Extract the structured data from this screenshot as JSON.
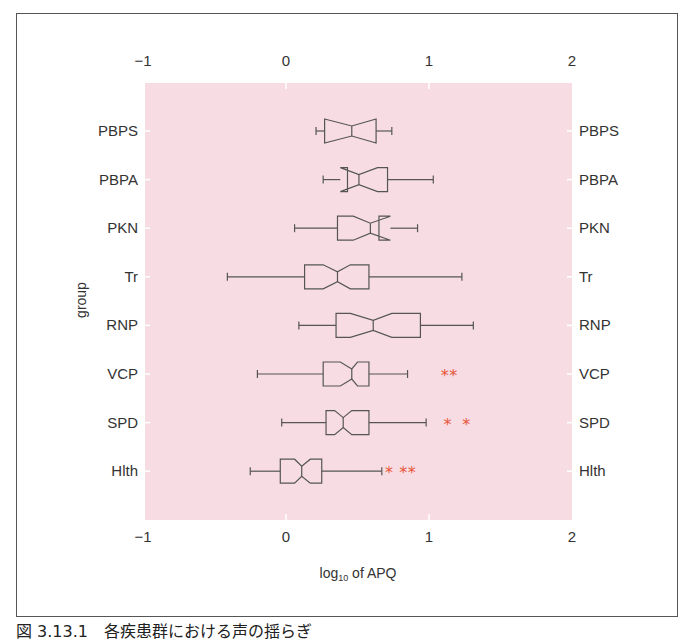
{
  "chart_data": {
    "type": "boxplot",
    "orientation": "horizontal",
    "notched": true,
    "title": "",
    "xlabel": "log10 of APQ",
    "xlabel_main": "log",
    "xlabel_sub": "10",
    "xlabel_rest": " of APQ",
    "ylabel": "group",
    "xlim": [
      -1,
      2
    ],
    "xticks": [
      -1,
      0,
      1,
      2
    ],
    "xtick_labels": [
      "−1",
      "0",
      "1",
      "2"
    ],
    "grid": false,
    "background_color": "#f7dde3",
    "outlier_color": "#e8553a",
    "outlier_marker": "*",
    "categories": [
      "PBPS",
      "PBPA",
      "PKN",
      "Tr",
      "RNP",
      "VCP",
      "SPD",
      "Hlth"
    ],
    "series": [
      {
        "name": "PBPS",
        "whisker_low": 0.21,
        "q1": 0.27,
        "notch_low": 0.27,
        "median": 0.46,
        "notch_high": 0.63,
        "q3": 0.63,
        "whisker_high": 0.74,
        "outliers": []
      },
      {
        "name": "PBPA",
        "whisker_low": 0.26,
        "q1": 0.43,
        "notch_low": 0.38,
        "median": 0.51,
        "notch_high": 0.64,
        "q3": 0.71,
        "whisker_high": 1.03,
        "outliers": []
      },
      {
        "name": "PKN",
        "whisker_low": 0.06,
        "q1": 0.36,
        "notch_low": 0.47,
        "median": 0.59,
        "notch_high": 0.73,
        "q3": 0.65,
        "whisker_high": 0.92,
        "outliers": []
      },
      {
        "name": "Tr",
        "whisker_low": -0.41,
        "q1": 0.13,
        "notch_low": 0.26,
        "median": 0.36,
        "notch_high": 0.45,
        "q3": 0.58,
        "whisker_high": 1.23,
        "outliers": []
      },
      {
        "name": "RNP",
        "whisker_low": 0.09,
        "q1": 0.35,
        "notch_low": 0.45,
        "median": 0.61,
        "notch_high": 0.74,
        "q3": 0.94,
        "whisker_high": 1.31,
        "outliers": []
      },
      {
        "name": "VCP",
        "whisker_low": -0.2,
        "q1": 0.26,
        "notch_low": 0.38,
        "median": 0.46,
        "notch_high": 0.5,
        "q3": 0.58,
        "whisker_high": 0.85,
        "outliers": [
          1.11,
          1.17
        ]
      },
      {
        "name": "SPD",
        "whisker_low": -0.03,
        "q1": 0.28,
        "notch_low": 0.34,
        "median": 0.4,
        "notch_high": 0.46,
        "q3": 0.58,
        "whisker_high": 0.98,
        "outliers": [
          1.13,
          1.26
        ]
      },
      {
        "name": "Hlth",
        "whisker_low": -0.25,
        "q1": -0.04,
        "notch_low": 0.06,
        "median": 0.11,
        "notch_high": 0.17,
        "q3": 0.25,
        "whisker_high": 0.67,
        "outliers": [
          0.72,
          0.82,
          0.88
        ]
      }
    ]
  },
  "caption": "図 3.13.1　各疾患群における声の揺らぎ"
}
